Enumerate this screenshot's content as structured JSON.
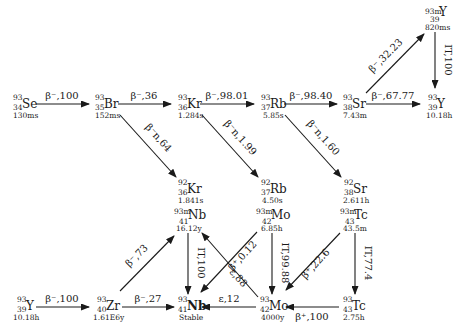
{
  "diagram": {
    "type": "decay-chain",
    "nuclides": [
      {
        "id": "se93",
        "mass": "93",
        "z": "34",
        "symbol": "Se",
        "halflife": "130ms"
      },
      {
        "id": "br93",
        "mass": "93",
        "z": "35",
        "symbol": "Br",
        "halflife": "152ms"
      },
      {
        "id": "kr93",
        "mass": "93",
        "z": "36",
        "symbol": "Kr",
        "halflife": "1.284s"
      },
      {
        "id": "rb93",
        "mass": "93",
        "z": "37",
        "symbol": "Rb",
        "halflife": "5.85s"
      },
      {
        "id": "sr93",
        "mass": "93",
        "z": "38",
        "symbol": "Sr",
        "halflife": "7.43m"
      },
      {
        "id": "y93m",
        "mass": "93m",
        "z": "39",
        "symbol": "Y",
        "halflife": "820ms"
      },
      {
        "id": "y93a",
        "mass": "93",
        "z": "39",
        "symbol": "Y",
        "halflife": "10.18h"
      },
      {
        "id": "kr92",
        "mass": "92",
        "z": "36",
        "symbol": "Kr",
        "halflife": "1.841s"
      },
      {
        "id": "rb92",
        "mass": "92",
        "z": "37",
        "symbol": "Rb",
        "halflife": "4.50s"
      },
      {
        "id": "sr92",
        "mass": "92",
        "z": "38",
        "symbol": "Sr",
        "halflife": "2.611h"
      },
      {
        "id": "nb93m",
        "mass": "93m",
        "z": "41",
        "symbol": "Nb",
        "halflife": "16.12y"
      },
      {
        "id": "mo93m",
        "mass": "93m",
        "z": "42",
        "symbol": "Mo",
        "halflife": "6.85h"
      },
      {
        "id": "tc93m",
        "mass": "93m",
        "z": "43",
        "symbol": "Tc",
        "halflife": "43.5m"
      },
      {
        "id": "y93b",
        "mass": "93",
        "z": "39",
        "symbol": "Y",
        "halflife": "10.18h"
      },
      {
        "id": "zr93",
        "mass": "93",
        "z": "40",
        "symbol": "Zr",
        "halflife": "1.61E6y"
      },
      {
        "id": "nb93",
        "mass": "93",
        "z": "41",
        "symbol": "Nb",
        "halflife": "Stable"
      },
      {
        "id": "mo93",
        "mass": "93",
        "z": "42",
        "symbol": "Mo",
        "halflife": "4000y"
      },
      {
        "id": "tc93",
        "mass": "93",
        "z": "43",
        "symbol": "Tc",
        "halflife": "2.75h"
      }
    ],
    "transitions": [
      {
        "from": "se93",
        "to": "br93",
        "label": "β⁻,100"
      },
      {
        "from": "br93",
        "to": "kr93",
        "label": "β⁻,36"
      },
      {
        "from": "kr93",
        "to": "rb93",
        "label": "β⁻,98.01"
      },
      {
        "from": "rb93",
        "to": "sr93",
        "label": "β⁻,98.40"
      },
      {
        "from": "sr93",
        "to": "y93a",
        "label": "β⁻,67.77"
      },
      {
        "from": "sr93",
        "to": "y93m",
        "label": "β⁻,32.23"
      },
      {
        "from": "y93m",
        "to": "y93a",
        "label": "IT,100"
      },
      {
        "from": "br93",
        "to": "kr92",
        "label": "β⁻n,64"
      },
      {
        "from": "kr93",
        "to": "rb92",
        "label": "β⁻n,1.99"
      },
      {
        "from": "rb93",
        "to": "sr92",
        "label": "β⁻n,1.60"
      },
      {
        "from": "y93b",
        "to": "zr93",
        "label": "β⁻,100"
      },
      {
        "from": "zr93",
        "to": "nb93m",
        "label": "β⁻,73"
      },
      {
        "from": "zr93",
        "to": "nb93",
        "label": "β⁻,27"
      },
      {
        "from": "nb93m",
        "to": "nb93",
        "label": "IT,100"
      },
      {
        "from": "mo93",
        "to": "nb93m",
        "label": "ε,88"
      },
      {
        "from": "mo93m",
        "to": "nb93",
        "label": "β⁺,0.12"
      },
      {
        "from": "mo93m",
        "to": "mo93",
        "label": "IT,99.88"
      },
      {
        "from": "mo93",
        "to": "nb93",
        "label": "ε,12"
      },
      {
        "from": "tc93m",
        "to": "mo93",
        "label": "β⁺,22.6"
      },
      {
        "from": "tc93m",
        "to": "tc93",
        "label": "IT,77.4"
      },
      {
        "from": "tc93",
        "to": "mo93",
        "label": "β⁺,100"
      }
    ]
  }
}
